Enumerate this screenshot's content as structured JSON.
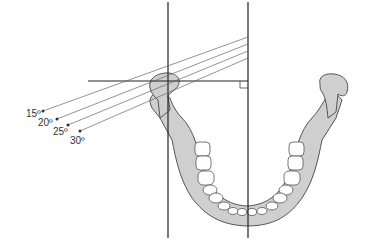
{
  "diagram": {
    "angle_labels": [
      "15º",
      "20º",
      "25º",
      "30º"
    ],
    "colors": {
      "bone_fill": "#cfcfcf",
      "bone_stroke": "#555555",
      "tooth_fill": "#ffffff",
      "line": "#222222",
      "ray": "#666666"
    }
  }
}
